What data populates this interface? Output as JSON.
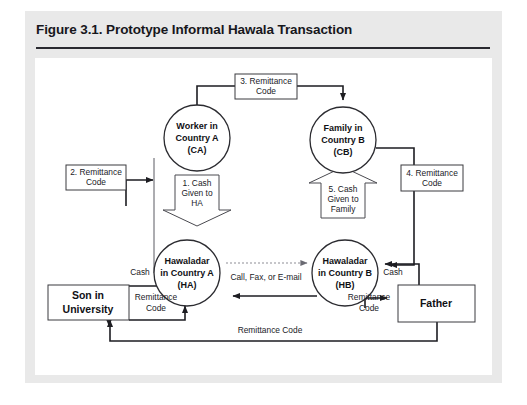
{
  "figure": {
    "title": "Figure 3.1. Prototype Informal Hawala Transaction"
  },
  "nodes": {
    "worker": {
      "line1": "Worker in",
      "line2": "Country A",
      "line3": "(CA)"
    },
    "family": {
      "line1": "Family in",
      "line2": "Country B",
      "line3": "(CB)"
    },
    "hawaladar_a": {
      "line1": "Hawaladar",
      "line2": "in Country A",
      "line3": "(HA)"
    },
    "hawaladar_b": {
      "line1": "Hawaladar",
      "line2": "in Country B",
      "line3": "(HB)"
    },
    "son": {
      "line1": "Son in",
      "line2": "University"
    },
    "father": {
      "line1": "Father"
    }
  },
  "steps": {
    "step1": {
      "line1": "1. Cash",
      "line2": "Given to",
      "line3": "HA"
    },
    "step2": {
      "line1": "2. Remittance",
      "line2": "Code"
    },
    "step3": {
      "line1": "3. Remittance",
      "line2": "Code"
    },
    "step4": {
      "line1": "4. Remittance",
      "line2": "Code"
    },
    "step5": {
      "line1": "5. Cash",
      "line2": "Given to",
      "line3": "Family"
    }
  },
  "edge_labels": {
    "call_fax_email": "Call, Fax, or E-mail",
    "cash_left": "Cash",
    "cash_right": "Cash",
    "remittance_code_left_1": "Remittance",
    "remittance_code_left_2": "Code",
    "remittance_code_right_1": "Remittance",
    "remittance_code_right_2": "Code",
    "remittance_code_bottom": "Remittance Code"
  },
  "colors": {
    "frame": "#e9e9e9",
    "panel": "#ffffff",
    "ink": "#1d1d22",
    "rule": "#2a2a30"
  }
}
